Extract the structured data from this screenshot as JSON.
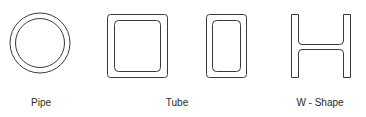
{
  "diagram": {
    "stroke_color": "#3a3a3a",
    "background": "#ffffff",
    "shapes": [
      {
        "id": "pipe",
        "label": "Pipe",
        "kind": "circle-ring"
      },
      {
        "id": "tube-square",
        "kind": "rounded-rect-ring"
      },
      {
        "id": "tube-rect",
        "kind": "rounded-rect-ring"
      },
      {
        "id": "w-shape",
        "kind": "i-beam"
      }
    ],
    "labels": {
      "pipe": "Pipe",
      "tube": "Tube",
      "w_shape": "W - Shape"
    }
  }
}
